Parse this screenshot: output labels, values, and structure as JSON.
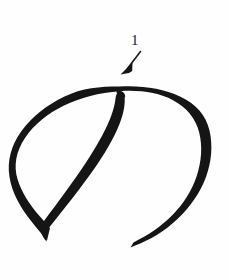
{
  "canvas": {
    "width": 229,
    "height": 280,
    "background_color": "#fefefe",
    "ink_color": "#151515"
  },
  "figure": {
    "kind": "handwritten-brush-stroke",
    "stroke_count": 1,
    "extents": {
      "left": 15,
      "right": 212,
      "top": 85,
      "bottom": 250
    },
    "key_points": {
      "start_junction": "118,95",
      "bottom_left_vertex": "48,238",
      "tail_end": "130,247",
      "leftmost": "16,170",
      "rightmost": "211,162",
      "topmost": "120,86"
    }
  },
  "annotations": [
    {
      "id": "stroke-1",
      "label": "1",
      "label_x": 135,
      "label_y": 42,
      "arrow_tail_x": 140,
      "arrow_tail_y": 52,
      "arrow_tip_x": 122,
      "arrow_tip_y": 73,
      "color": "#1b1b1b",
      "points_to": "start of stroke 1"
    }
  ]
}
